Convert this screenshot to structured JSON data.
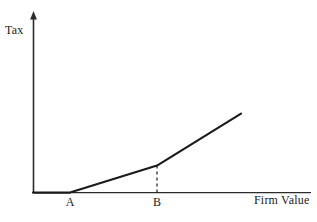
{
  "chart_data": {
    "type": "line",
    "title": "",
    "xlabel": "Firm Value",
    "ylabel": "Tax",
    "grid": false,
    "legend": null,
    "axis_style": "arrow-y-axis",
    "annotations": [
      {
        "name": "A",
        "label": "A",
        "x": 70,
        "y": 0,
        "note": "kink point where tax begins"
      },
      {
        "name": "B",
        "label": "B",
        "x": 157,
        "y": 27,
        "note": "kink point where tax rate increases"
      }
    ],
    "dashed_guides": [
      {
        "from_point": "B",
        "orientation": "vertical",
        "x": 157,
        "y_top": 27,
        "y_bottom": 0
      }
    ],
    "series": [
      {
        "name": "tax-schedule",
        "color": "#1a1a1a",
        "points": [
          {
            "x": 33,
            "y": 0
          },
          {
            "x": 70,
            "y": 0
          },
          {
            "x": 157,
            "y": 27
          },
          {
            "x": 241,
            "y": 79
          }
        ]
      }
    ],
    "xlim": [
      33,
      311
    ],
    "ylim": [
      0,
      180
    ]
  },
  "labels": {
    "y_axis": "Tax",
    "x_axis": "Firm Value",
    "tick_a": "A",
    "tick_b": "B"
  },
  "colors": {
    "line": "#1a1a1a",
    "axis": "#2b2b2b",
    "background": "#ffffff",
    "text": "#1a1a1a"
  }
}
